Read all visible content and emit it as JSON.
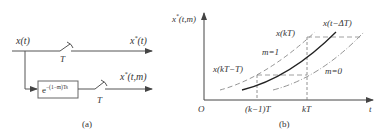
{
  "panel_a": {
    "caption": "(a)",
    "input_label": "x(t)",
    "switch_top_label": "T",
    "output_top_label": "x*(t)",
    "output_top_base": "x",
    "output_top_sup": "*",
    "output_top_arg": "(t)",
    "block_base": "e",
    "block_exponent": "−(1−m)Ts",
    "switch_bottom_label": "T",
    "output_bottom_base": "x",
    "output_bottom_sup": "*",
    "output_bottom_arg": "(t,m)"
  },
  "panel_b": {
    "caption": "(b)",
    "y_axis_base": "x",
    "y_axis_sup": "*",
    "y_axis_arg": "(t,m)",
    "x_axis_label": "t",
    "origin_label": "O",
    "tick_labels": [
      "(k−1)T",
      "kT"
    ],
    "curve_labels": {
      "x_kT": "x(kT)",
      "x_t_minus_dT": "x(t−ΔT)",
      "x_kT_minus_T": "x(kT−T)",
      "m1": "m=1",
      "m0": "m=0"
    }
  },
  "colors": {
    "line": "#555555",
    "curve": "#222222",
    "dashed": "#888888",
    "text": "#333333"
  }
}
